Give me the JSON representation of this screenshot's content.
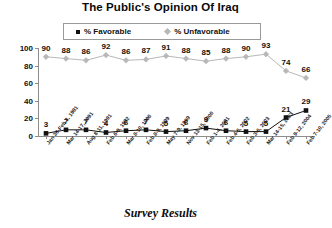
{
  "chart_data": {
    "type": "line",
    "title": "The Public's Opinion Of Iraq",
    "caption": "Survey Results",
    "xlabel": "",
    "ylabel": "",
    "ylim": [
      0,
      100
    ],
    "yticks": [
      100,
      80,
      60,
      40,
      20,
      0
    ],
    "grid": false,
    "legend_position": "top-center",
    "categories": [
      "Jan 30-Feb 2, 1991",
      "Mar 14-17, 1991",
      "Aug 8-11, 1991",
      "Feb 6-9, 1992",
      "Mar 8-10, 1996",
      "Feb 8-9, 1999",
      "May 7-9, 1999",
      "Nov 13-15, 2000",
      "Feb 1-4, 2001",
      "Feb 4-6, 2002",
      "Feb 3-6, 2003",
      "Mar 14-15, 2003",
      "Feb 9-12, 2004",
      "Feb 7-10, 2005"
    ],
    "series": [
      {
        "name": "% Favorable",
        "marker": "square",
        "color": "#111111",
        "values": [
          3,
          7,
          7,
          4,
          6,
          7,
          5,
          6,
          9,
          6,
          5,
          5,
          21,
          29
        ]
      },
      {
        "name": "% Unfavorable",
        "marker": "diamond",
        "color": "#b8b8b8",
        "values": [
          90,
          88,
          86,
          92,
          86,
          87,
          91,
          88,
          85,
          88,
          90,
          93,
          74,
          66
        ]
      }
    ]
  },
  "legend": {
    "items": [
      {
        "label": "% Favorable",
        "marker": "square-marker-icon"
      },
      {
        "label": "% Unfavorable",
        "marker": "diamond-marker-icon"
      }
    ]
  }
}
